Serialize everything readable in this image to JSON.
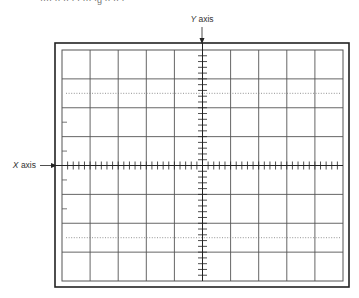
{
  "caption_fragment": "···· ·· ·· · · ··· ·g ·· ·· ·",
  "labels": {
    "y_axis_italic": "Y",
    "y_axis_rest": " axis",
    "x_axis_italic": "X",
    "x_axis_rest": " axis"
  },
  "graticule": {
    "columns": 10,
    "rows": 8,
    "minor_ticks_per_division": 5,
    "dotted_line_rows": [
      1.5,
      6.5
    ],
    "edge_tick_rows": [
      2.5,
      3.5,
      4.5,
      5.5
    ]
  },
  "colors": {
    "frame": "#222222",
    "grid": "#555555",
    "dotted": "#777777",
    "text": "#333333"
  }
}
